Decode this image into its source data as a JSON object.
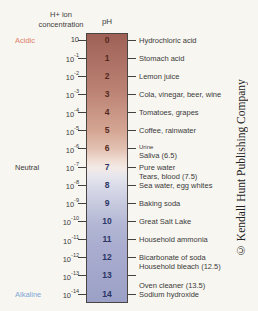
{
  "header": {
    "h_ion_line1": "H+ ion",
    "h_ion_line2": "concentration",
    "ph_label": "pH"
  },
  "side_labels": {
    "acidic": "Acidic",
    "neutral": "Neutral",
    "alkaline": "Alkaline"
  },
  "colors": {
    "background": "#f8f6f1",
    "acidic_label": "#dd8168",
    "neutral_label": "#3a3a3a",
    "alkaline_label": "#82a7d6",
    "number_acidic": "#53291f",
    "number_alkaline": "#2c3565",
    "bar_border": "#4a4542",
    "tick": "#454040",
    "label_text": "#3a3a3a"
  },
  "bar_gradient": [
    {
      "pos": 0,
      "color": "#9f6156"
    },
    {
      "pos": 7,
      "color": "#a86c60"
    },
    {
      "pos": 21,
      "color": "#bb8273"
    },
    {
      "pos": 36,
      "color": "#d4a593"
    },
    {
      "pos": 43,
      "color": "#e3c2b3"
    },
    {
      "pos": 47,
      "color": "#f0dcd2"
    },
    {
      "pos": 50,
      "color": "#f3eae6"
    },
    {
      "pos": 53,
      "color": "#e7e6ed"
    },
    {
      "pos": 57,
      "color": "#d8dae8"
    },
    {
      "pos": 64,
      "color": "#c5c8dd"
    },
    {
      "pos": 71,
      "color": "#b3b7d4"
    },
    {
      "pos": 79,
      "color": "#aaadcf"
    },
    {
      "pos": 100,
      "color": "#9ba0c6"
    }
  ],
  "scale": {
    "rows": [
      {
        "ph": "0",
        "concentration_base": "10",
        "concentration_exponent": "",
        "labels": [
          "Hydrochloric acid"
        ]
      },
      {
        "ph": "1",
        "concentration_base": "10",
        "concentration_exponent": "-1",
        "labels": [
          "Stomach acid"
        ]
      },
      {
        "ph": "2",
        "concentration_base": "10",
        "concentration_exponent": "-2",
        "labels": [
          "Lemon juice"
        ]
      },
      {
        "ph": "3",
        "concentration_base": "10",
        "concentration_exponent": "-3",
        "labels": [
          "Cola, vinegar, beer, wine"
        ]
      },
      {
        "ph": "4",
        "concentration_base": "10",
        "concentration_exponent": "-4",
        "labels": [
          "Tomatoes, grapes"
        ]
      },
      {
        "ph": "5",
        "concentration_base": "10",
        "concentration_exponent": "-5",
        "labels": [
          "Coffee, rainwater"
        ]
      },
      {
        "ph": "6",
        "concentration_base": "10",
        "concentration_exponent": "-6",
        "labels": [
          "Urine",
          "Saliva (6.5)"
        ],
        "small_first": true
      },
      {
        "ph": "7",
        "concentration_base": "10",
        "concentration_exponent": "-7",
        "labels": [
          "Pure water",
          "Tears, blood (7.5)"
        ]
      },
      {
        "ph": "8",
        "concentration_base": "10",
        "concentration_exponent": "-8",
        "labels": [
          "Sea water, egg whites"
        ]
      },
      {
        "ph": "9",
        "concentration_base": "10",
        "concentration_exponent": "-9",
        "labels": [
          "Baking soda"
        ]
      },
      {
        "ph": "10",
        "concentration_base": "10",
        "concentration_exponent": "-10",
        "labels": [
          "Great Salt Lake"
        ]
      },
      {
        "ph": "11",
        "concentration_base": "10",
        "concentration_exponent": "-11",
        "labels": [
          "Household ammonia"
        ]
      },
      {
        "ph": "12",
        "concentration_base": "10",
        "concentration_exponent": "-12",
        "labels": [
          "Bicarbonate of soda",
          "Household bleach (12.5)"
        ]
      },
      {
        "ph": "13",
        "concentration_base": "10",
        "concentration_exponent": "-13",
        "labels": []
      },
      {
        "ph": "14",
        "concentration_base": "10",
        "concentration_exponent": "-14",
        "labels": [
          "Oven cleaner (13.5)",
          "Sodium hydroxide"
        ],
        "label_align": "last"
      }
    ]
  },
  "copyright": "© Kendall Hunt Publishing Company"
}
